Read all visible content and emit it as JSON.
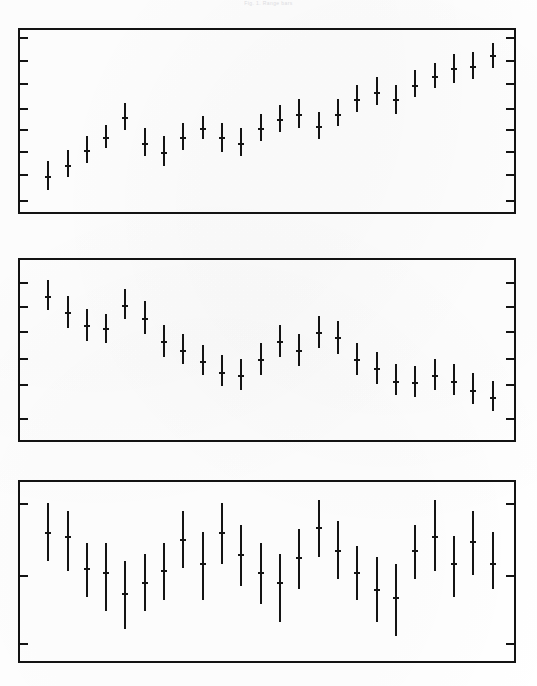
{
  "figure": {
    "caption": "Fig. 1.  Range bars",
    "panel_count": 3,
    "colors": {
      "ink": "#131313",
      "paper": "#ffffff"
    }
  },
  "chart_data": [
    {
      "type": "bar",
      "title": "Panel 1 - upward trend range bars",
      "subtitle": "",
      "xlabel": "",
      "ylabel": "",
      "grid": false,
      "legend": "none",
      "xlim": [
        0,
        25
      ],
      "ylim": [
        0,
        100
      ],
      "yticks_count": 8,
      "xticks_count": 0,
      "categories": [
        "1",
        "2",
        "3",
        "4",
        "5",
        "6",
        "7",
        "8",
        "9",
        "10",
        "11",
        "12",
        "13",
        "14",
        "15",
        "16",
        "17",
        "18",
        "19",
        "20",
        "21",
        "22",
        "23",
        "24"
      ],
      "series": [
        {
          "name": "range",
          "center": [
            20,
            26,
            34,
            41,
            52,
            38,
            33,
            41,
            46,
            41,
            38,
            46,
            51,
            54,
            47,
            54,
            62,
            66,
            62,
            70,
            75,
            79,
            80,
            86
          ],
          "low": [
            12,
            19,
            27,
            35,
            45,
            31,
            25,
            34,
            40,
            33,
            31,
            39,
            44,
            46,
            40,
            47,
            55,
            59,
            54,
            63,
            68,
            71,
            73,
            79
          ],
          "high": [
            28,
            34,
            42,
            48,
            60,
            46,
            42,
            49,
            53,
            49,
            46,
            54,
            59,
            62,
            55,
            62,
            70,
            74,
            70,
            78,
            82,
            87,
            88,
            93
          ]
        }
      ]
    },
    {
      "type": "bar",
      "title": "Panel 2 - downward trend range bars",
      "subtitle": "",
      "xlabel": "",
      "ylabel": "",
      "grid": false,
      "legend": "none",
      "xlim": [
        0,
        25
      ],
      "ylim": [
        0,
        100
      ],
      "yticks_count": 6,
      "xticks_count": 0,
      "categories": [
        "1",
        "2",
        "3",
        "4",
        "5",
        "6",
        "7",
        "8",
        "9",
        "10",
        "11",
        "12",
        "13",
        "14",
        "15",
        "16",
        "17",
        "18",
        "19",
        "20",
        "21",
        "22",
        "23",
        "24"
      ],
      "series": [
        {
          "name": "range",
          "center": [
            80,
            71,
            64,
            62,
            75,
            68,
            55,
            50,
            44,
            38,
            36,
            45,
            55,
            50,
            60,
            57,
            45,
            40,
            33,
            32,
            36,
            33,
            28,
            24
          ],
          "low": [
            72,
            62,
            55,
            54,
            67,
            59,
            46,
            42,
            36,
            30,
            28,
            36,
            46,
            41,
            51,
            48,
            36,
            31,
            25,
            24,
            28,
            25,
            20,
            16
          ],
          "high": [
            89,
            80,
            73,
            70,
            84,
            77,
            64,
            59,
            53,
            47,
            45,
            54,
            64,
            59,
            69,
            66,
            54,
            49,
            42,
            41,
            45,
            42,
            37,
            33
          ]
        }
      ]
    },
    {
      "type": "bar",
      "title": "Panel 3 - scattered long range bars",
      "subtitle": "",
      "xlabel": "",
      "ylabel": "",
      "grid": false,
      "legend": "none",
      "xlim": [
        0,
        25
      ],
      "ylim": [
        0,
        100
      ],
      "yticks_count": 3,
      "xticks_count": 0,
      "categories": [
        "1",
        "2",
        "3",
        "4",
        "5",
        "6",
        "7",
        "8",
        "9",
        "10",
        "11",
        "12",
        "13",
        "14",
        "15",
        "16",
        "17",
        "18",
        "19",
        "20",
        "21",
        "22",
        "23",
        "24"
      ],
      "series": [
        {
          "name": "range",
          "center": [
            72,
            70,
            52,
            50,
            38,
            44,
            51,
            68,
            55,
            72,
            60,
            50,
            44,
            58,
            75,
            62,
            50,
            40,
            36,
            62,
            70,
            55,
            67,
            55
          ],
          "low": [
            56,
            50,
            36,
            28,
            18,
            28,
            34,
            52,
            34,
            54,
            42,
            32,
            22,
            40,
            58,
            46,
            34,
            22,
            14,
            46,
            50,
            36,
            48,
            40
          ],
          "high": [
            88,
            84,
            66,
            66,
            56,
            60,
            66,
            84,
            72,
            88,
            76,
            66,
            60,
            74,
            90,
            78,
            64,
            58,
            54,
            76,
            90,
            70,
            84,
            72
          ]
        }
      ]
    }
  ],
  "panels": [
    {
      "name": "panel-1",
      "x": 18,
      "y": 28,
      "width": 498,
      "height": 186
    },
    {
      "name": "panel-2",
      "x": 18,
      "y": 258,
      "width": 498,
      "height": 184
    },
    {
      "name": "panel-3",
      "x": 18,
      "y": 480,
      "width": 498,
      "height": 183
    }
  ],
  "tick_fractions": {
    "panel-1": [
      0.04,
      0.165,
      0.29,
      0.43,
      0.545,
      0.665,
      0.79,
      0.935
    ],
    "panel-2": [
      0.12,
      0.255,
      0.395,
      0.545,
      0.69,
      0.875
    ],
    "panel-3": [
      0.12,
      0.52,
      0.9
    ]
  }
}
